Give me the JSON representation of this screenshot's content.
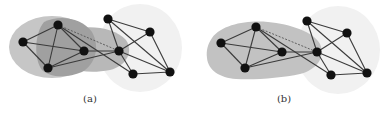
{
  "figure": {
    "panels": [
      {
        "id": "a",
        "caption": "(a)",
        "caption_x": 90,
        "nodes": {
          "A1": [
            23,
            42
          ],
          "A2": [
            58,
            25
          ],
          "A3": [
            84,
            51
          ],
          "A4": [
            48,
            68
          ],
          "B1": [
            108,
            19
          ],
          "B2": [
            150,
            32
          ],
          "B3": [
            119,
            51
          ],
          "B4": [
            133,
            74
          ],
          "B5": [
            170,
            72
          ]
        },
        "edges": [
          [
            "A1",
            "A2"
          ],
          [
            "A1",
            "A3"
          ],
          [
            "A1",
            "A4"
          ],
          [
            "A2",
            "A3"
          ],
          [
            "A2",
            "A4"
          ],
          [
            "A3",
            "A4"
          ],
          [
            "A3",
            "B3"
          ],
          [
            "A4",
            "B3"
          ],
          [
            "A2",
            "B4"
          ],
          [
            "B1",
            "B2"
          ],
          [
            "B1",
            "B3"
          ],
          [
            "B1",
            "B5"
          ],
          [
            "B2",
            "B3"
          ],
          [
            "B2",
            "B5"
          ],
          [
            "B3",
            "B4"
          ],
          [
            "B3",
            "B5"
          ],
          [
            "B4",
            "B5"
          ]
        ],
        "dashed_edges": [
          [
            "A2",
            "B3"
          ]
        ],
        "regions": [
          "outer-light-ellipse",
          "inner-dark-region",
          "bridge-band",
          "right-halo"
        ]
      },
      {
        "id": "b",
        "caption": "(b)",
        "caption_x": 284,
        "nodes": {
          "A1": [
            221,
            43
          ],
          "A2": [
            256,
            27
          ],
          "A3": [
            282,
            52
          ],
          "A4": [
            245,
            68
          ],
          "B1": [
            307,
            21
          ],
          "B2": [
            347,
            33
          ],
          "B3": [
            317,
            52
          ],
          "B4": [
            331,
            75
          ],
          "B5": [
            367,
            73
          ]
        },
        "edges": [
          [
            "A1",
            "A2"
          ],
          [
            "A1",
            "A3"
          ],
          [
            "A1",
            "A4"
          ],
          [
            "A2",
            "A3"
          ],
          [
            "A2",
            "A4"
          ],
          [
            "A3",
            "A4"
          ],
          [
            "A3",
            "B3"
          ],
          [
            "A4",
            "B3"
          ],
          [
            "A2",
            "B4"
          ],
          [
            "B1",
            "B2"
          ],
          [
            "B1",
            "B3"
          ],
          [
            "B1",
            "B5"
          ],
          [
            "B2",
            "B3"
          ],
          [
            "B2",
            "B5"
          ],
          [
            "B3",
            "B4"
          ],
          [
            "B3",
            "B5"
          ],
          [
            "B4",
            "B5"
          ]
        ],
        "dashed_edges": [
          [
            "A2",
            "B3"
          ]
        ],
        "regions": [
          "single-gray-blob",
          "right-halo"
        ]
      }
    ],
    "colors": {
      "node": "#111111",
      "edge": "#3a3a3a",
      "outer_region": "#c4c4c4",
      "inner_region": "#9e9e9e",
      "bridge_region": "#b3b3b3",
      "blob_b": "#c2c2c2",
      "halo": "#f1f1f1"
    }
  }
}
